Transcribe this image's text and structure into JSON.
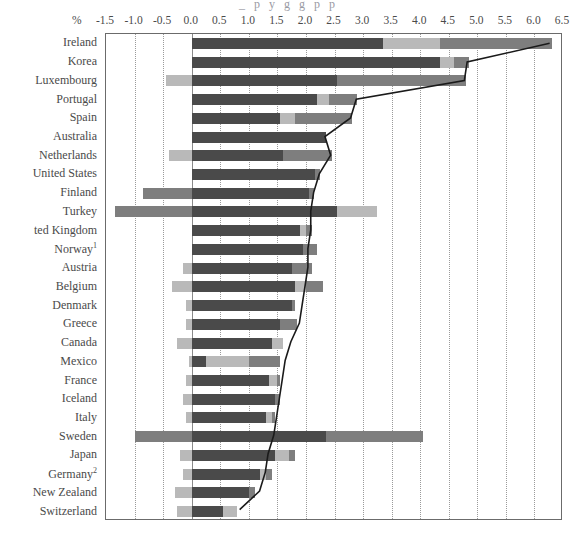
{
  "top_caption_sliver": "_ p y g g p p",
  "axis": {
    "unit_label": "%",
    "ticks": [
      -1.5,
      -1.0,
      -0.5,
      0.0,
      0.5,
      1.0,
      1.5,
      2.0,
      2.5,
      3.0,
      3.5,
      4.0,
      4.5,
      5.0,
      5.5,
      6.0,
      6.5
    ],
    "tick_labels": [
      "-1.5",
      "-1.0",
      "-0.5",
      "0.0",
      "0.5",
      "1.0",
      "1.5",
      "2.0",
      "2.5",
      "3.0",
      "3.5",
      "4.0",
      "4.5",
      "5.0",
      "5.5",
      "6.0",
      "6.5"
    ],
    "min": -1.5,
    "max": 6.5
  },
  "colors": {
    "segment_a": "#4a4a4a",
    "segment_b": "#b9b9b9",
    "segment_c": "#7e7e7e",
    "line": "#1a1a1a",
    "frame": "#6b6b6b",
    "grid": "#9a9a9a",
    "text": "#4a4a4a"
  },
  "chart_data": {
    "type": "bar",
    "orientation": "horizontal",
    "stacked": true,
    "title": "",
    "xlabel": "%",
    "ylabel": "",
    "xlim": [
      -1.5,
      6.5
    ],
    "grid": true,
    "legend": null,
    "categories": [
      "Ireland",
      "Korea",
      "Luxembourg",
      "Portugal",
      "Spain",
      "Australia",
      "Netherlands",
      "United States",
      "Finland",
      "Turkey",
      "ted Kingdom",
      "Norway",
      "Austria",
      "Belgium",
      "Denmark",
      "Greece",
      "Canada",
      "Mexico",
      "France",
      "Iceland",
      "Italy",
      "Sweden",
      "Japan",
      "Germany",
      "New Zealand",
      "Switzerland"
    ],
    "category_footnotes": {
      "Norway": "1",
      "Germany": "2"
    },
    "series": [
      {
        "name": "segment_a",
        "color": "#4a4a4a",
        "values": [
          3.35,
          4.35,
          2.55,
          2.2,
          1.55,
          2.35,
          1.6,
          2.15,
          2.05,
          2.55,
          1.9,
          1.95,
          1.75,
          1.8,
          1.75,
          1.55,
          1.4,
          0.25,
          1.35,
          1.45,
          1.3,
          2.35,
          1.45,
          1.2,
          1.0,
          0.55
        ]
      },
      {
        "name": "segment_b",
        "color": "#b9b9b9",
        "values": [
          1.0,
          0.25,
          0.0,
          0.2,
          0.25,
          0.0,
          0.0,
          0.0,
          0.0,
          0.7,
          0.1,
          0.0,
          0.0,
          0.2,
          0.0,
          0.0,
          0.2,
          0.75,
          0.15,
          0.0,
          0.1,
          0.0,
          0.25,
          0.1,
          0.0,
          0.25
        ]
      },
      {
        "name": "segment_c",
        "color": "#7e7e7e",
        "values": [
          1.95,
          0.25,
          2.25,
          0.5,
          1.0,
          0.0,
          0.85,
          0.1,
          0.1,
          0.0,
          0.1,
          0.25,
          0.35,
          0.3,
          0.05,
          0.3,
          0.0,
          0.55,
          0.05,
          0.1,
          0.05,
          1.7,
          0.1,
          0.1,
          0.1,
          0.0
        ]
      }
    ],
    "negative_segments": {
      "Luxembourg": {
        "value": -0.45,
        "color": "#b9b9b9"
      },
      "Netherlands": {
        "value": -0.4,
        "color": "#b9b9b9"
      },
      "Finland": {
        "value": -0.85,
        "color": "#7e7e7e"
      },
      "Turkey": {
        "value": -1.35,
        "color": "#7e7e7e"
      },
      "Austria": {
        "value": -0.15,
        "color": "#b9b9b9"
      },
      "Belgium": {
        "value": -0.35,
        "color": "#b9b9b9"
      },
      "Denmark": {
        "value": -0.1,
        "color": "#b9b9b9"
      },
      "Greece": {
        "value": -0.1,
        "color": "#b9b9b9"
      },
      "Canada": {
        "value": -0.25,
        "color": "#b9b9b9"
      },
      "Mexico": {
        "value": -0.05,
        "color": "#b9b9b9"
      },
      "France": {
        "value": -0.1,
        "color": "#b9b9b9"
      },
      "Iceland": {
        "value": -0.15,
        "color": "#b9b9b9"
      },
      "Italy": {
        "value": -0.1,
        "color": "#b9b9b9"
      },
      "Sweden": {
        "value": -1.0,
        "color": "#7e7e7e"
      },
      "Japan": {
        "value": -0.2,
        "color": "#b9b9b9"
      },
      "Germany": {
        "value": -0.15,
        "color": "#b9b9b9"
      },
      "New Zealand": {
        "value": -0.3,
        "color": "#b9b9b9"
      },
      "Switzerland": {
        "value": -0.25,
        "color": "#b9b9b9"
      }
    },
    "line_series": {
      "name": "total",
      "color": "#1a1a1a",
      "values": [
        6.3,
        4.85,
        4.8,
        2.9,
        2.8,
        2.35,
        2.45,
        2.25,
        2.15,
        2.1,
        2.1,
        2.05,
        2.05,
        2.0,
        1.95,
        1.9,
        1.75,
        1.65,
        1.6,
        1.55,
        1.5,
        1.45,
        1.35,
        1.3,
        1.2,
        0.85
      ]
    }
  }
}
